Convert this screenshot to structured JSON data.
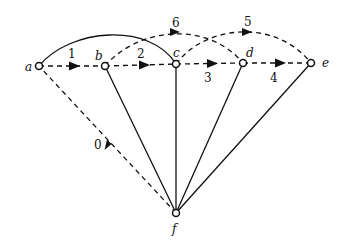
{
  "diagram": {
    "type": "directed-graph",
    "nodes": [
      {
        "id": "a",
        "label": "a"
      },
      {
        "id": "b",
        "label": "b"
      },
      {
        "id": "c",
        "label": "c"
      },
      {
        "id": "d",
        "label": "d"
      },
      {
        "id": "e",
        "label": "e"
      },
      {
        "id": "f",
        "label": "f"
      }
    ],
    "edges": [
      {
        "from": "a",
        "to": "b",
        "label": "1",
        "style": "dashed",
        "directed": true
      },
      {
        "from": "b",
        "to": "c",
        "label": "2",
        "style": "dashed",
        "directed": true
      },
      {
        "from": "c",
        "to": "d",
        "label": "3",
        "style": "dashed",
        "directed": true
      },
      {
        "from": "d",
        "to": "e",
        "label": "4",
        "style": "dashed",
        "directed": true
      },
      {
        "from": "c",
        "to": "e",
        "label": "5",
        "style": "dashed-arc",
        "directed": true
      },
      {
        "from": "b",
        "to": "d",
        "label": "6",
        "style": "dashed-arc",
        "directed": true
      },
      {
        "from": "f",
        "to": "a",
        "label": "0",
        "style": "dashed",
        "directed": true
      },
      {
        "from": "a",
        "to": "c",
        "label": "",
        "style": "solid-arc",
        "directed": false
      },
      {
        "from": "f",
        "to": "b",
        "label": "",
        "style": "solid",
        "directed": false
      },
      {
        "from": "f",
        "to": "c",
        "label": "",
        "style": "solid",
        "directed": false
      },
      {
        "from": "f",
        "to": "d",
        "label": "",
        "style": "solid",
        "directed": false
      },
      {
        "from": "f",
        "to": "e",
        "label": "",
        "style": "solid",
        "directed": false
      }
    ]
  }
}
